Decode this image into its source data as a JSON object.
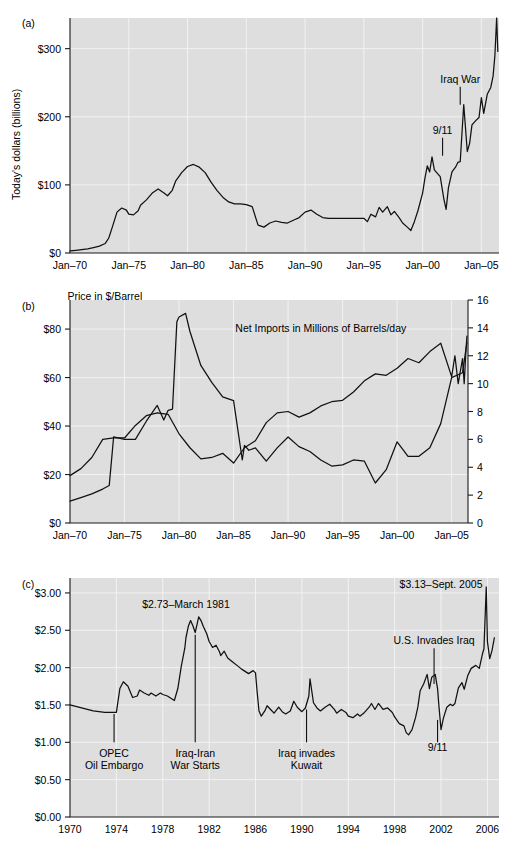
{
  "figure": {
    "background_color": "#ffffff",
    "plot_background_color": "#dedede",
    "grid_color": "#f2f2f2",
    "line_color": "#111111"
  },
  "panels": [
    {
      "id": "a",
      "letter": "(a)",
      "ylabel": "Today's dollars (billions)",
      "ytick_labels": [
        "$0",
        "$100",
        "$200",
        "$300"
      ],
      "xtick_labels": [
        "Jan–70",
        "Jan–75",
        "Jan–80",
        "Jan–85",
        "Jan–90",
        "Jan–95",
        "Jan–00",
        "Jan–05"
      ],
      "annotations": [
        {
          "label": "9/11",
          "x": 2001.7,
          "y": 175
        },
        {
          "label": "Iraq War",
          "x": 2003.2,
          "y": 250
        }
      ]
    },
    {
      "id": "b",
      "letter": "(b)",
      "ytick_labels_left": [
        "$0",
        "$20",
        "$40",
        "$60",
        "$80"
      ],
      "ytick_labels_right": [
        "0",
        "2",
        "4",
        "6",
        "8",
        "10",
        "12",
        "14",
        "16"
      ],
      "xtick_labels": [
        "Jan–70",
        "Jan–75",
        "Jan–80",
        "Jan–85",
        "Jan–90",
        "Jan–95",
        "Jan–00",
        "Jan–05"
      ],
      "annotations": [
        {
          "label": "Price in $/Barrel",
          "x": 1973.2,
          "y": 92
        },
        {
          "label": "Net Imports in Millions of Barrels/day",
          "x": 1993.0,
          "y": 79
        }
      ]
    },
    {
      "id": "c",
      "letter": "(c)",
      "ytick_labels": [
        "$0.00",
        "$0.50",
        "$1.00",
        "$1.50",
        "$2.00",
        "$2.50",
        "$3.00"
      ],
      "xtick_labels": [
        "1970",
        "1974",
        "1978",
        "1982",
        "1986",
        "1990",
        "1994",
        "1998",
        "2002",
        "2006"
      ],
      "annotations": [
        {
          "label_lines": [
            "OPEC",
            "Oil Embargo"
          ],
          "x": 1973.8,
          "y_text": 0.8,
          "leader_top": 1.38,
          "leader_bottom": 1.0
        },
        {
          "label_lines": [
            "Iraq-Iran",
            "War Starts"
          ],
          "x": 1980.8,
          "y_text": 0.8,
          "leader_top": 2.44,
          "leader_bottom": 1.0
        },
        {
          "label_lines": [
            "Iraq invades",
            "Kuwait"
          ],
          "x": 1990.4,
          "y_text": 0.8,
          "leader_top": 1.44,
          "leader_bottom": 1.0
        },
        {
          "label_lines": [
            "9/11"
          ],
          "x": 2001.7,
          "y_text": 0.88,
          "leader_top": 1.3,
          "leader_bottom": 1.0
        },
        {
          "label_lines": [
            "$2.73–March 1981"
          ],
          "x": 1980.0,
          "y_text": 2.8,
          "leader_top": null,
          "leader_bottom": null
        },
        {
          "label_lines": [
            "U.S. Invades Iraq"
          ],
          "x": 2001.4,
          "y_text": 2.32,
          "leader_top": 2.26,
          "leader_bottom": 1.78
        },
        {
          "label_lines": [
            "$3.13–Sept. 2005"
          ],
          "x": 2002.0,
          "y_text": 3.07,
          "leader_top": null,
          "leader_bottom": null
        }
      ]
    }
  ],
  "chart_data": [
    {
      "type": "line",
      "panel": "a",
      "title": "",
      "xlabel": "",
      "ylabel": "Today's dollars (billions)",
      "xlim": [
        1970,
        2006.5
      ],
      "ylim": [
        0,
        345
      ],
      "xticks": [
        1970,
        1975,
        1980,
        1985,
        1990,
        1995,
        2000,
        2005
      ],
      "xticklabels": [
        "Jan–70",
        "Jan–75",
        "Jan–80",
        "Jan–85",
        "Jan–90",
        "Jan–95",
        "Jan–00",
        "Jan–05"
      ],
      "yticks": [
        0,
        100,
        200,
        300
      ],
      "yticklabels": [
        "$0",
        "$100",
        "$200",
        "$300"
      ],
      "grid": true,
      "legend": "none",
      "series": [
        {
          "name": "Value of oil imports (today's dollars, billions)",
          "x": [
            1970,
            1970.5,
            1971,
            1971.5,
            1972,
            1972.5,
            1973,
            1973.3,
            1973.6,
            1974,
            1974.4,
            1974.8,
            1975,
            1975.4,
            1975.8,
            1976,
            1976.5,
            1977,
            1977.5,
            1978,
            1978.3,
            1978.7,
            1979,
            1979.5,
            1980,
            1980.5,
            1981,
            1981.5,
            1982,
            1982.5,
            1983,
            1983.5,
            1984,
            1984.5,
            1985,
            1985.5,
            1986,
            1986.5,
            1987,
            1987.5,
            1988,
            1988.5,
            1989,
            1989.5,
            1990,
            1990.5,
            1991,
            1991.5,
            1992,
            1992.5,
            1993,
            1993.5,
            1994,
            1994.5,
            1995,
            1995.3,
            1995.6,
            1996,
            1996.3,
            1996.6,
            1997,
            1997.3,
            1997.6,
            1998,
            1998.3,
            1998.7,
            1999,
            1999.3,
            1999.6,
            2000,
            2000.2,
            2000.4,
            2000.6,
            2000.8,
            2001,
            2001.2,
            2001.5,
            2001.8,
            2002,
            2002.2,
            2002.5,
            2002.8,
            2003,
            2003.2,
            2003.5,
            2003.8,
            2004,
            2004.2,
            2004.5,
            2004.8,
            2005,
            2005.2,
            2005.5,
            2005.8,
            2006,
            2006.15,
            2006.3,
            2006.4
          ],
          "y": [
            3,
            4,
            5,
            6,
            8,
            10,
            14,
            22,
            38,
            60,
            66,
            63,
            57,
            56,
            62,
            70,
            78,
            88,
            94,
            88,
            84,
            92,
            106,
            118,
            127,
            130,
            126,
            118,
            104,
            92,
            82,
            75,
            72,
            72,
            71,
            68,
            41,
            38,
            44,
            47,
            45,
            44,
            48,
            52,
            60,
            63,
            57,
            52,
            51,
            51,
            51,
            51,
            51,
            51,
            51,
            46,
            57,
            53,
            67,
            60,
            68,
            56,
            61,
            52,
            44,
            38,
            33,
            46,
            62,
            88,
            110,
            128,
            119,
            141,
            122,
            118,
            112,
            80,
            64,
            96,
            119,
            126,
            133,
            134,
            218,
            149,
            161,
            188,
            194,
            199,
            228,
            205,
            233,
            243,
            260,
            290,
            345,
            296,
            292,
            310
          ]
        }
      ]
    },
    {
      "type": "line",
      "panel": "b",
      "title": "",
      "xlabel": "",
      "ylabel_left": "Price in $/Barrel",
      "ylabel_right": "Net Imports in Millions of Barrels/day",
      "xlim": [
        1970,
        2006.5
      ],
      "ylim_left": [
        0,
        92
      ],
      "ylim_right": [
        0,
        16
      ],
      "xticks": [
        1970,
        1975,
        1980,
        1985,
        1990,
        1995,
        2000,
        2005
      ],
      "xticklabels": [
        "Jan–70",
        "Jan–75",
        "Jan–80",
        "Jan–85",
        "Jan–90",
        "Jan–95",
        "Jan–00",
        "Jan–05"
      ],
      "yticks_left": [
        0,
        20,
        40,
        60,
        80
      ],
      "yticklabels_left": [
        "$0",
        "$20",
        "$40",
        "$60",
        "$80"
      ],
      "yticks_right": [
        0,
        2,
        4,
        6,
        8,
        10,
        12,
        14,
        16
      ],
      "yticklabels_right": [
        "0",
        "2",
        "4",
        "6",
        "8",
        "10",
        "12",
        "14",
        "16"
      ],
      "grid": true,
      "legend": "inline-annotation",
      "series": [
        {
          "name": "Price in $/Barrel",
          "axis": "left",
          "x": [
            1970,
            1971,
            1972,
            1973,
            1973.6,
            1974,
            1974.5,
            1975,
            1976,
            1977,
            1978,
            1978.6,
            1979,
            1979.4,
            1979.8,
            1980,
            1980.6,
            1981,
            1982,
            1983,
            1984,
            1985,
            1985.8,
            1986,
            1986.4,
            1987,
            1988,
            1989,
            1990,
            1991,
            1992,
            1993,
            1994,
            1995,
            1996,
            1997,
            1998,
            1999,
            2000,
            2001,
            2002,
            2003,
            2004,
            2005,
            2006,
            2006.4
          ],
          "y": [
            9,
            10.5,
            12,
            14,
            15.5,
            35.5,
            35,
            34.5,
            34.5,
            42,
            48.5,
            42.5,
            46.5,
            47,
            83,
            85,
            86.5,
            79,
            65,
            58,
            52,
            50.5,
            26,
            32,
            30,
            31,
            25.5,
            31,
            35.5,
            31.5,
            29.5,
            26,
            23.5,
            24,
            26,
            25.5,
            16.5,
            22,
            33.5,
            27.5,
            27.5,
            31,
            41,
            60,
            62,
            74.5
          ]
        },
        {
          "name": "Net Imports in Millions of Barrels/day",
          "axis": "right",
          "x": [
            1970,
            1971,
            1972,
            1973,
            1974,
            1975,
            1976,
            1977,
            1978,
            1979,
            1980,
            1981,
            1982,
            1983,
            1984,
            1985,
            1986,
            1987,
            1988,
            1989,
            1990,
            1991,
            1992,
            1993,
            1994,
            1995,
            1996,
            1997,
            1998,
            1999,
            2000,
            2001,
            2002,
            2003,
            2004,
            2005,
            2005.3,
            2005.6,
            2006,
            2006.15,
            2006.3,
            2006.4
          ],
          "y": [
            3.4,
            3.9,
            4.7,
            6.0,
            6.1,
            6.1,
            7.0,
            7.7,
            7.9,
            7.8,
            6.4,
            5.4,
            4.6,
            4.7,
            5.0,
            4.3,
            5.4,
            5.9,
            7.2,
            7.9,
            8.0,
            7.6,
            7.9,
            8.4,
            8.7,
            8.8,
            9.4,
            10.2,
            10.7,
            10.6,
            11.1,
            11.8,
            11.5,
            12.3,
            12.9,
            10.5,
            12.0,
            10.0,
            11.8,
            10.0,
            12.2,
            13.4
          ]
        }
      ]
    },
    {
      "type": "line",
      "panel": "c",
      "title": "",
      "xlabel": "",
      "ylabel": "Retail gasoline price (today's dollars per gallon)",
      "xlim": [
        1970,
        2007
      ],
      "ylim": [
        0,
        3.2
      ],
      "xticks": [
        1970,
        1974,
        1978,
        1982,
        1986,
        1990,
        1994,
        1998,
        2002,
        2006
      ],
      "xticklabels": [
        "1970",
        "1974",
        "1978",
        "1982",
        "1986",
        "1990",
        "1994",
        "1998",
        "2002",
        "2006"
      ],
      "yticks": [
        0,
        0.5,
        1.0,
        1.5,
        2.0,
        2.5,
        3.0
      ],
      "yticklabels": [
        "$0.00",
        "$0.50",
        "$1.00",
        "$1.50",
        "$2.00",
        "$2.50",
        "$3.00"
      ],
      "grid": true,
      "legend": "none",
      "series": [
        {
          "name": "Gasoline price per gallon (inflation adjusted)",
          "x": [
            1970,
            1970.5,
            1971,
            1971.5,
            1972,
            1972.5,
            1973,
            1973.5,
            1973.9,
            1974.0,
            1974.3,
            1974.6,
            1975,
            1975.4,
            1975.8,
            1976,
            1976.4,
            1976.8,
            1977,
            1977.4,
            1977.8,
            1978,
            1978.4,
            1978.8,
            1979,
            1979.3,
            1979.6,
            1979.9,
            1980,
            1980.2,
            1980.4,
            1980.6,
            1980.8,
            1981,
            1981.1,
            1981.3,
            1981.5,
            1981.8,
            1982,
            1982.3,
            1982.6,
            1982.9,
            1983,
            1983.3,
            1983.6,
            1984,
            1984.4,
            1984.8,
            1985,
            1985.4,
            1985.8,
            1986,
            1986.15,
            1986.3,
            1986.5,
            1986.8,
            1987,
            1987.3,
            1987.6,
            1988,
            1988.3,
            1988.6,
            1989,
            1989.3,
            1989.6,
            1990,
            1990.3,
            1990.6,
            1990.7,
            1991,
            1991.3,
            1991.6,
            1992,
            1992.4,
            1992.8,
            1993,
            1993.4,
            1993.8,
            1994,
            1994.4,
            1994.8,
            1995,
            1995.4,
            1995.8,
            1996,
            1996.3,
            1996.6,
            1997,
            1997.4,
            1997.8,
            1998,
            1998.4,
            1998.8,
            1999,
            1999.2,
            1999.5,
            1999.8,
            2000,
            2000.2,
            2000.5,
            2000.8,
            2001,
            2001.2,
            2001.5,
            2001.7,
            2001.8,
            2002,
            2002.2,
            2002.5,
            2002.8,
            2003,
            2003.2,
            2003.5,
            2003.8,
            2004,
            2004.3,
            2004.6,
            2005,
            2005.3,
            2005.6,
            2005.7,
            2005.9,
            2006,
            2006.2,
            2006.4,
            2006.6
          ],
          "y": [
            1.5,
            1.48,
            1.46,
            1.44,
            1.42,
            1.41,
            1.4,
            1.4,
            1.4,
            1.4,
            1.72,
            1.81,
            1.75,
            1.6,
            1.62,
            1.7,
            1.66,
            1.63,
            1.66,
            1.62,
            1.66,
            1.64,
            1.62,
            1.58,
            1.56,
            1.72,
            2.02,
            2.26,
            2.4,
            2.55,
            2.63,
            2.56,
            2.47,
            2.61,
            2.68,
            2.63,
            2.55,
            2.45,
            2.35,
            2.27,
            2.3,
            2.21,
            2.16,
            2.22,
            2.13,
            2.08,
            2.03,
            1.98,
            1.96,
            1.92,
            1.96,
            1.93,
            1.66,
            1.42,
            1.35,
            1.42,
            1.49,
            1.44,
            1.39,
            1.47,
            1.41,
            1.38,
            1.42,
            1.55,
            1.47,
            1.41,
            1.46,
            1.62,
            1.85,
            1.53,
            1.46,
            1.42,
            1.47,
            1.51,
            1.44,
            1.39,
            1.44,
            1.4,
            1.35,
            1.33,
            1.38,
            1.35,
            1.4,
            1.47,
            1.52,
            1.44,
            1.52,
            1.44,
            1.46,
            1.4,
            1.34,
            1.25,
            1.22,
            1.13,
            1.1,
            1.17,
            1.33,
            1.47,
            1.69,
            1.78,
            1.91,
            1.72,
            1.87,
            1.91,
            1.72,
            1.52,
            1.17,
            1.32,
            1.47,
            1.51,
            1.49,
            1.52,
            1.73,
            1.8,
            1.71,
            1.89,
            1.99,
            2.03,
            1.99,
            2.2,
            2.25,
            3.08,
            2.35,
            2.12,
            2.23,
            2.4,
            2.88,
            2.55
          ]
        }
      ]
    }
  ]
}
